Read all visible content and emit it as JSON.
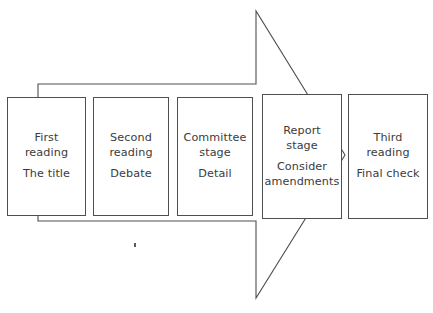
{
  "diagram": {
    "type": "process-flow-arrow",
    "background_color": "#ffffff",
    "line_color": "#4f4f4f",
    "text_color": "#3b3b3b",
    "arrow": {
      "name": "process-arrow",
      "direction": "right",
      "body": {
        "x": 38,
        "y": 84,
        "width": 218,
        "height": 137
      },
      "head": {
        "top_x": 256,
        "top_y": 11,
        "tip_x": 345,
        "tip_y": 155,
        "bottom_x": 256,
        "bottom_y": 298
      }
    },
    "speck": {
      "x": 134,
      "y": 243,
      "width": 2,
      "height": 4
    },
    "stages": [
      {
        "id": "first-reading",
        "title": "First\nreading",
        "subtitle": "The title",
        "x": 7,
        "y": 97,
        "width": 79,
        "height": 119
      },
      {
        "id": "second-reading",
        "title": "Second\nreading",
        "subtitle": "Debate",
        "x": 93,
        "y": 97,
        "width": 76,
        "height": 119
      },
      {
        "id": "committee-stage",
        "title": "Committee\nstage",
        "subtitle": "Detail",
        "x": 177,
        "y": 97,
        "width": 76,
        "height": 119
      },
      {
        "id": "report-stage",
        "title": "Report\nstage",
        "subtitle": "Consider\namendments",
        "x": 262,
        "y": 94,
        "width": 80,
        "height": 125
      },
      {
        "id": "third-reading",
        "title": "Third\nreading",
        "subtitle": "Final check",
        "x": 348,
        "y": 94,
        "width": 80,
        "height": 125
      }
    ]
  }
}
